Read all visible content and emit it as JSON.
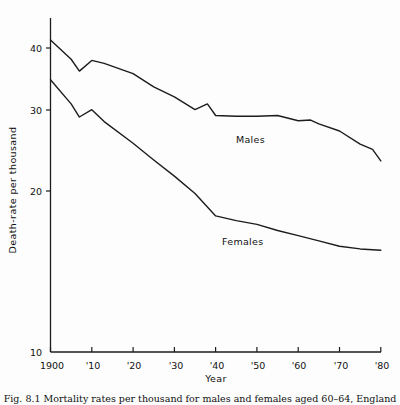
{
  "chart_data": {
    "type": "line",
    "title": "",
    "xlabel": "Year",
    "ylabel": "Death-rate per thousand",
    "yscale": "log",
    "ylim": [
      10,
      45
    ],
    "xlim": [
      1900,
      1980
    ],
    "grid": false,
    "legend_position": "inline-annotations",
    "ytick_labels": [
      "40",
      "30",
      "20",
      "10"
    ],
    "ytick_values": [
      40,
      30,
      20,
      10
    ],
    "xtick_labels": [
      "1900",
      "'10",
      "'20",
      "'30",
      "'40",
      "'50",
      "'60",
      "'70",
      "'80"
    ],
    "xtick_values": [
      1900,
      1910,
      1920,
      1930,
      1940,
      1950,
      1960,
      1970,
      1980
    ],
    "series": [
      {
        "name": "Males",
        "label": "Males",
        "color": "#1c1c1c",
        "x": [
          1900,
          1905,
          1907,
          1910,
          1913,
          1920,
          1925,
          1930,
          1935,
          1938,
          1940,
          1945,
          1950,
          1955,
          1960,
          1963,
          1965,
          1970,
          1975,
          1978,
          1980
        ],
        "values": [
          41.5,
          38.0,
          36.0,
          37.8,
          37.3,
          35.6,
          33.5,
          32.0,
          30.2,
          31.0,
          29.4,
          29.3,
          29.3,
          29.4,
          28.7,
          28.8,
          28.3,
          27.4,
          25.8,
          25.2,
          23.9
        ]
      },
      {
        "name": "Females",
        "label": "Females",
        "color": "#1c1c1c",
        "x": [
          1900,
          1905,
          1907,
          1910,
          1913,
          1920,
          1925,
          1930,
          1935,
          1940,
          1945,
          1950,
          1955,
          1960,
          1965,
          1970,
          1975,
          1980
        ],
        "values": [
          34.6,
          31.0,
          29.2,
          30.2,
          28.6,
          25.9,
          24.0,
          22.3,
          20.6,
          18.6,
          18.2,
          17.9,
          17.4,
          17.0,
          16.6,
          16.2,
          16.0,
          15.9
        ]
      }
    ]
  },
  "axes": {
    "y_title": "Death-rate per thousand",
    "x_title": "Year"
  },
  "annotations": {
    "males_label": "Males",
    "females_label": "Females"
  },
  "caption": {
    "text": "Fig. 8.1 Mortality rates per thousand for males and females aged 60–64, England"
  }
}
